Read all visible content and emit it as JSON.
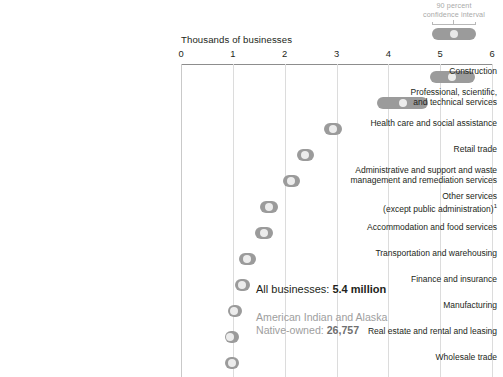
{
  "chart_data": {
    "type": "bar",
    "title": "",
    "xlabel": "Thousands of businesses",
    "ylabel": "",
    "xlim": [
      0,
      6
    ],
    "ticks": [
      "0",
      "1",
      "2",
      "3",
      "4",
      "5",
      "6"
    ],
    "grid": true,
    "legend_position": "top-right",
    "legend_label": "90 percent\nconfidence interval",
    "categories": [
      "Construction",
      "Professional, scientific,\nand technical services",
      "Health care and social assistance",
      "Retail trade",
      "Administrative and support and waste\nmanagement and remediation services",
      "Other services\n(except public administration)",
      "Accommodation and food services",
      "Transportation and warehousing",
      "Finance and insurance",
      "Manufacturing",
      "Real estate and rental and leasing",
      "Wholesale trade"
    ],
    "values": [
      5.23,
      4.28,
      2.93,
      2.4,
      2.13,
      1.7,
      1.6,
      1.28,
      1.18,
      1.02,
      0.95,
      0.98
    ],
    "ci_low": [
      4.81,
      3.79,
      2.76,
      2.24,
      1.97,
      1.52,
      1.42,
      1.12,
      1.04,
      0.9,
      0.85,
      0.85
    ],
    "ci_high": [
      5.68,
      4.77,
      3.11,
      2.57,
      2.3,
      1.88,
      1.78,
      1.45,
      1.33,
      1.14,
      1.06,
      1.12
    ],
    "footnote_marker": "1"
  },
  "annotation": {
    "line1_label": "All businesses: ",
    "line1_value": "5.4 million",
    "line2": "American Indian and Alaska\nNative-owned: ",
    "line2_value": "26,757"
  }
}
